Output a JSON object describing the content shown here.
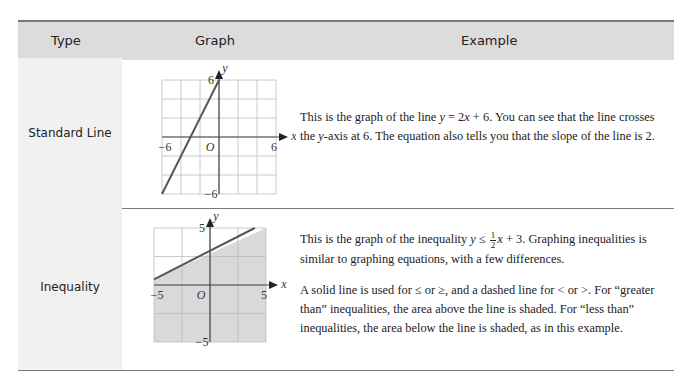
{
  "header": {
    "type": "Type",
    "graph": "Graph",
    "example": "Example"
  },
  "rows": [
    {
      "type": "Standard Line",
      "graph": {
        "x_label": "x",
        "y_label": "y",
        "origin_label": "O",
        "x_min_label": "−6",
        "x_max_label": "6",
        "y_min_label": "−6",
        "y_max_label": "6",
        "range": [
          -6,
          6
        ],
        "line": {
          "slope": 2,
          "intercept": 6
        },
        "shading": "none"
      },
      "text": {
        "p1_a": "This is the graph of the line ",
        "eq_y": "y",
        "eq_mid": " = 2",
        "eq_x": "x",
        "eq_end": " + 6. You can see that the line crosses the ",
        "axis_y": "y",
        "p1_b": "-axis at 6. The equation also tells you that the slope of the line is 2."
      }
    },
    {
      "type": "Inequality",
      "graph": {
        "x_label": "x",
        "y_label": "y",
        "origin_label": "O",
        "x_min_label": "−5",
        "x_max_label": "5",
        "y_min_label": "−5",
        "y_max_label": "5",
        "range": [
          -5,
          5
        ],
        "line": {
          "slope": 0.5,
          "intercept": 3
        },
        "shading": "below",
        "shade_color": "#d9d9d9"
      },
      "text": {
        "p1_a": "This is the graph of the inequality ",
        "eq_y": "y",
        "eq_op": " ≤ ",
        "frac_num": "1",
        "frac_den": "2",
        "eq_x": "x",
        "p1_b": " + 3. Graphing inequalities is similar to graphing equations, with a few differences.",
        "p2": "A solid line is used for ≤ or ≥, and a dashed line for < or >. For “greater than” inequalities, the area above the line is shaded. For “less than” inequalities, the area below the line is shaded, as in this example."
      }
    }
  ]
}
